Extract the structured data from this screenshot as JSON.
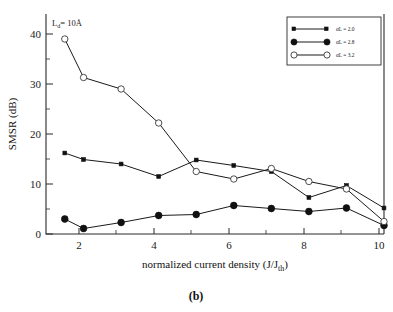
{
  "figure": {
    "caption": "(b)",
    "annotation": {
      "full": "Ld = 10Å",
      "base": "L",
      "subscript": "d",
      "equals": "= 10",
      "unit": "Å"
    }
  },
  "chart_data": {
    "type": "line",
    "title": "",
    "xlabel": "normalized current density (J/J th)",
    "xlabel_parts": {
      "main": "normalized current density (J/J",
      "sub": "th",
      "tail": ")"
    },
    "ylabel": "SMSR (dB)",
    "xlim": [
      1.0,
      10.0
    ],
    "ylim": [
      0,
      44
    ],
    "xticks": [
      2,
      4,
      6,
      8,
      10
    ],
    "yticks": [
      0,
      10,
      20,
      30,
      40
    ],
    "xticklabels": [
      "2",
      "4",
      "6",
      "8",
      "10"
    ],
    "yticklabels": [
      "0",
      "10",
      "20",
      "30",
      "40"
    ],
    "xminorticks": [
      1.5,
      2.5,
      3,
      3.5,
      4.5,
      5,
      5.5,
      6.5,
      7,
      7.5,
      8.5,
      9,
      9.5
    ],
    "yminorticks": [
      5,
      15,
      25,
      35
    ],
    "grid": false,
    "legend_position": "top-right",
    "x": [
      1.5,
      2,
      3,
      4,
      5,
      6,
      7,
      8,
      9,
      10
    ],
    "series": [
      {
        "name": "aL = 2.0",
        "label": "αL = 2.0",
        "marker": "filled-square",
        "values": [
          16.2,
          14.9,
          14.0,
          11.5,
          14.8,
          13.7,
          12.5,
          7.3,
          9.7,
          5.2
        ]
      },
      {
        "name": "aL = 2.8",
        "label": "αL = 2.8",
        "marker": "filled-circle",
        "values": [
          3.0,
          1.1,
          2.3,
          3.7,
          3.9,
          5.7,
          5.1,
          4.5,
          5.2,
          1.7
        ]
      },
      {
        "name": "aL = 3.2",
        "label": "αL = 3.2",
        "marker": "open-circle",
        "values": [
          39.0,
          31.3,
          29.0,
          22.2,
          12.5,
          11.0,
          13.1,
          10.5,
          9.0,
          2.5
        ]
      }
    ],
    "colors": {
      "line": "#1a1a1a",
      "axis": "#2b2b2b",
      "background": "#ffffff"
    }
  }
}
